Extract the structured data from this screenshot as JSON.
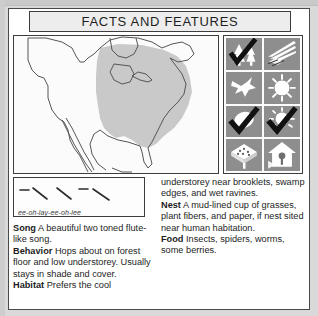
{
  "card": {
    "title": "FACTS AND FEATURES"
  },
  "map": {
    "name": "north-america-range-map",
    "range_fill": "#c9c9c9",
    "outline": "#555555",
    "background": "#fbfbfb",
    "description": "Range shaded over eastern and central North America"
  },
  "icons": {
    "panel_background": "#fbfbfb",
    "tile_background": "#8e8e8e",
    "glyph_color": "#ffffff",
    "check_color": "#1a1a1a",
    "items": [
      {
        "name": "forest-habitat-icon",
        "label": "forest",
        "checked": true
      },
      {
        "name": "ground-nest-icon",
        "label": "ground / leaf litter",
        "checked": false
      },
      {
        "name": "flying-bird-icon",
        "label": "bird in flight",
        "checked": false
      },
      {
        "name": "sun-icon",
        "label": "sun",
        "checked": false
      },
      {
        "name": "egg-icon",
        "label": "egg",
        "checked": true
      },
      {
        "name": "sun-partial-icon",
        "label": "partial sun",
        "checked": true
      },
      {
        "name": "platform-feeder-icon",
        "label": "platform feeder",
        "checked": false
      },
      {
        "name": "birdhouse-icon",
        "label": "nest box",
        "checked": false
      }
    ]
  },
  "sonogram": {
    "name": "song-sonogram",
    "transcription": "ee-oh-lay-ee-oh-lee",
    "marks": [
      {
        "type": "dash",
        "x1": 6,
        "y1": 12,
        "x2": 14,
        "y2": 12
      },
      {
        "type": "slope",
        "x1": 18,
        "y1": 10,
        "x2": 32,
        "y2": 21
      },
      {
        "type": "slope",
        "x1": 42,
        "y1": 10,
        "x2": 56,
        "y2": 21
      },
      {
        "type": "dash",
        "x1": 64,
        "y1": 11,
        "x2": 72,
        "y2": 11
      },
      {
        "type": "slope",
        "x1": 78,
        "y1": 11,
        "x2": 94,
        "y2": 22
      }
    ]
  },
  "facts": {
    "left_column": [
      {
        "term": "Song",
        "text": "A beautiful two toned flute-like song."
      },
      {
        "term": "Behavior",
        "text": "Hops about on forest floor and low understorey. Usually stays in shade and cover."
      },
      {
        "term": "Habitat",
        "text": "Prefers the cool"
      }
    ],
    "right_column_continuation": "understorey near brooklets, swamp edges, and wet ravines.",
    "right_column": [
      {
        "term": "Nest",
        "text": "A mud-lined cup of grasses, plant fibers, and paper, if nest sited near human habitation."
      },
      {
        "term": "Food",
        "text": "Insects, spiders, worms, some berries."
      }
    ]
  }
}
